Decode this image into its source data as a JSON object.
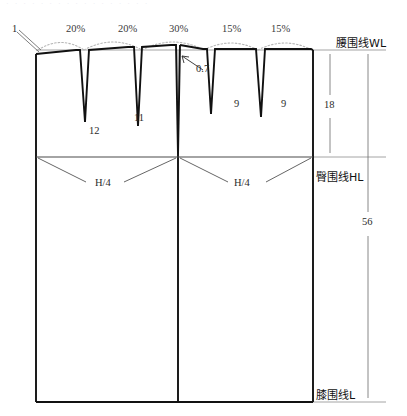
{
  "diagram": {
    "title_faint": "· · · ·  · · · ·  · · · · · ·      · · ·",
    "type": "skirt-pattern-draft",
    "waist_line_label": "腰围线WL",
    "hip_line_label": "臀围线HL",
    "knee_line_label": "膝围线L",
    "dart_distribution_labels": [
      "20%",
      "20%",
      "30%",
      "15%",
      "15%"
    ],
    "dart_depth_labels": [
      "12",
      "11",
      "9",
      "9"
    ],
    "ease_label": "0.7",
    "side_rise_label": "1",
    "quarter_hip_label_left": "H/4",
    "quarter_hip_label_right": "H/4",
    "waist_to_hip_measure": "18",
    "waist_to_knee_measure": "56"
  },
  "colors": {
    "outline": "#1a1a1a",
    "thin_line": "#8a8a8a",
    "dashed_arc": "#b8b8b8",
    "text": "#2b2b2b"
  },
  "geometry": {
    "left_edge_x": 36,
    "right_edge_x": 313,
    "center_x": 178,
    "waist_y": 50,
    "hip_y": 157,
    "knee_y": 402
  }
}
